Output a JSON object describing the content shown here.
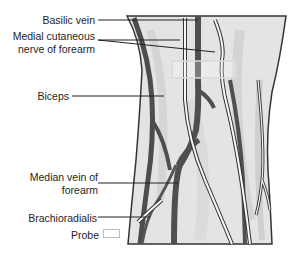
{
  "labels": {
    "basilic_vein": "Basilic vein",
    "medial_cutaneous_line1": "Medial cutaneous",
    "medial_cutaneous_line2": "nerve of forearm",
    "biceps": "Biceps",
    "median_vein_line1": "Median vein of",
    "median_vein_line2": "forearm",
    "brachioradialis": "Brachioradialis",
    "probe": "Probe"
  },
  "colors": {
    "vein": "#555555",
    "skin": "#e2e2e2",
    "outline": "#333333",
    "leader": "#222222",
    "nerve": "#f5f5f5",
    "probe_box": "#d6d6d6"
  }
}
